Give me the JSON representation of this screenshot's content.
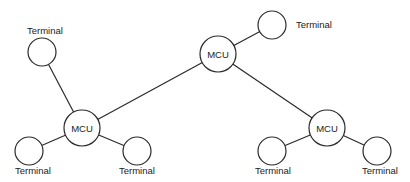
{
  "diagram": {
    "type": "network-topology",
    "nodes": [
      {
        "id": "mcu_top",
        "label": "MCU",
        "kind": "mcu",
        "cx": 218,
        "cy": 54,
        "r": 18
      },
      {
        "id": "mcu_left",
        "label": "MCU",
        "kind": "mcu",
        "cx": 82,
        "cy": 128,
        "r": 18
      },
      {
        "id": "mcu_right",
        "label": "MCU",
        "kind": "mcu",
        "cx": 327,
        "cy": 128,
        "r": 18
      },
      {
        "id": "t_top_right",
        "label": "Terminal",
        "kind": "terminal",
        "cx": 272,
        "cy": 25,
        "r": 14,
        "lx": 296,
        "ly": 28
      },
      {
        "id": "t_top_left",
        "label": "Terminal",
        "kind": "terminal",
        "cx": 42,
        "cy": 52,
        "r": 14,
        "lx": 27,
        "ly": 34
      },
      {
        "id": "t_bl_left",
        "label": "Terminal",
        "kind": "terminal",
        "cx": 29,
        "cy": 151,
        "r": 14,
        "lx": 15,
        "ly": 174
      },
      {
        "id": "t_bl_right",
        "label": "Terminal",
        "kind": "terminal",
        "cx": 137,
        "cy": 151,
        "r": 14,
        "lx": 119,
        "ly": 174
      },
      {
        "id": "t_br_left",
        "label": "Terminal",
        "kind": "terminal",
        "cx": 272,
        "cy": 151,
        "r": 14,
        "lx": 255,
        "ly": 174
      },
      {
        "id": "t_br_right",
        "label": "Terminal",
        "kind": "terminal",
        "cx": 377,
        "cy": 151,
        "r": 14,
        "lx": 362,
        "ly": 174
      }
    ],
    "edges": [
      [
        "mcu_top",
        "t_top_right"
      ],
      [
        "mcu_top",
        "mcu_left"
      ],
      [
        "mcu_top",
        "mcu_right"
      ],
      [
        "mcu_left",
        "t_top_left"
      ],
      [
        "mcu_left",
        "t_bl_left"
      ],
      [
        "mcu_left",
        "t_bl_right"
      ],
      [
        "mcu_right",
        "t_br_left"
      ],
      [
        "mcu_right",
        "t_br_right"
      ]
    ],
    "colors": {
      "stroke": "#2a2a2a",
      "fill": "#ffffff",
      "text": "#222222"
    }
  }
}
